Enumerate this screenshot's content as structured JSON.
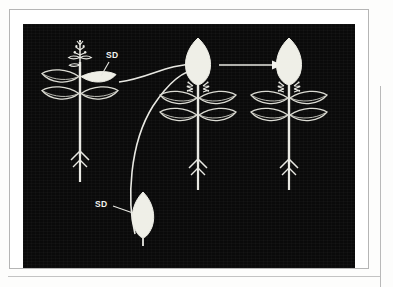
{
  "figure": {
    "panel_background": "#0a0a0a",
    "ink_color": "#f2f2ee",
    "frame_color": "#b5b5b5"
  },
  "labels": {
    "sd_leaf_on_plant": "SD",
    "sd_detached_leaf": "SD"
  },
  "plants": [
    {
      "id": "plant-donor",
      "name": "donor-plant-with-shaded-leaf",
      "apex": "inflorescence",
      "apex_state": "flowering-spike",
      "leaf_pairs": 2,
      "treated_leaf": "filled",
      "treated_leaf_label": "SD",
      "root": "tap-root-arrow"
    },
    {
      "id": "plant-receptor-1",
      "name": "induced-plant-middle",
      "apex": "apical-leaf",
      "apex_state": "filled-induced",
      "leaf_pairs": 2,
      "axillary_flowers": 2,
      "root": "tap-root-arrow"
    },
    {
      "id": "plant-receptor-2",
      "name": "induced-plant-right",
      "apex": "apical-leaf",
      "apex_state": "filled-induced",
      "leaf_pairs": 2,
      "axillary_flowers": 2,
      "root": "tap-root-arrow"
    }
  ],
  "detached_leaf": {
    "name": "detached-sd-leaf",
    "state": "filled",
    "label": "SD"
  },
  "arrows": [
    {
      "id": "arrow-curved-upper",
      "name": "arrow-from-shaded-leaf-to-middle-apex",
      "style": "curved",
      "from": "shaded leaf on donor plant",
      "to": "apex of middle plant"
    },
    {
      "id": "arrow-curved-lower",
      "name": "arrow-from-detached-leaf-to-middle-apex",
      "style": "curved",
      "from": "detached SD leaf",
      "to": "apex of middle plant"
    },
    {
      "id": "arrow-straight",
      "name": "arrow-from-middle-plant-to-right-plant",
      "style": "straight",
      "from": "middle plant apex",
      "to": "right plant apex"
    }
  ]
}
